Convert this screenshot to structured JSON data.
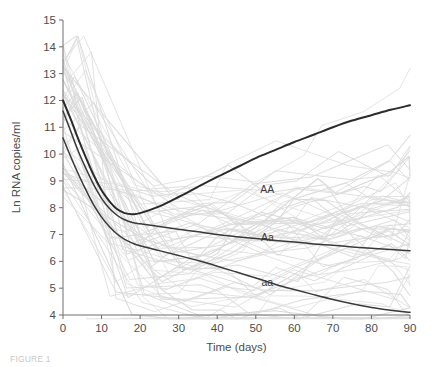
{
  "chart_data": {
    "type": "line",
    "title": "",
    "xlabel": "Time (days)",
    "ylabel": "Ln RNA copies/ml",
    "xlim": [
      0,
      90
    ],
    "ylim": [
      4,
      15
    ],
    "xticks": [
      0,
      10,
      20,
      30,
      40,
      50,
      60,
      70,
      80,
      90
    ],
    "yticks": [
      4,
      5,
      6,
      7,
      8,
      9,
      10,
      11,
      12,
      13,
      14,
      15
    ],
    "grid": false,
    "legend": "inline-annotations",
    "annotations": [
      {
        "text": "AA",
        "x": 53,
        "y": 8.55
      },
      {
        "text": "Aa",
        "x": 53,
        "y": 6.75
      },
      {
        "text": "aa",
        "x": 53,
        "y": 5.1
      }
    ],
    "series": [
      {
        "name": "AA",
        "color": "#2b2b2b",
        "width": 2.0,
        "x": [
          0,
          2,
          4,
          6,
          8,
          10,
          12,
          14,
          16,
          18,
          20,
          25,
          30,
          35,
          40,
          45,
          50,
          55,
          60,
          65,
          70,
          75,
          80,
          85,
          90
        ],
        "values": [
          12.0,
          11.3,
          10.55,
          9.85,
          9.2,
          8.65,
          8.25,
          7.95,
          7.8,
          7.76,
          7.8,
          8.05,
          8.4,
          8.78,
          9.15,
          9.5,
          9.85,
          10.15,
          10.45,
          10.72,
          11.0,
          11.25,
          11.45,
          11.65,
          11.82
        ]
      },
      {
        "name": "Aa",
        "color": "#3a3a3a",
        "width": 1.5,
        "x": [
          0,
          2,
          4,
          6,
          8,
          10,
          12,
          14,
          16,
          18,
          20,
          25,
          30,
          35,
          40,
          45,
          50,
          55,
          60,
          65,
          70,
          75,
          80,
          85,
          90
        ],
        "values": [
          11.6,
          10.85,
          10.1,
          9.45,
          8.85,
          8.35,
          7.98,
          7.72,
          7.55,
          7.45,
          7.4,
          7.3,
          7.2,
          7.1,
          7.0,
          6.92,
          6.85,
          6.78,
          6.72,
          6.65,
          6.6,
          6.54,
          6.49,
          6.44,
          6.4
        ]
      },
      {
        "name": "aa",
        "color": "#3a3a3a",
        "width": 1.5,
        "x": [
          0,
          2,
          4,
          6,
          8,
          10,
          12,
          14,
          16,
          18,
          20,
          25,
          30,
          35,
          40,
          45,
          50,
          55,
          60,
          65,
          70,
          75,
          80,
          85,
          90
        ],
        "values": [
          10.6,
          9.9,
          9.25,
          8.65,
          8.1,
          7.65,
          7.3,
          7.02,
          6.82,
          6.68,
          6.58,
          6.4,
          6.22,
          6.03,
          5.82,
          5.6,
          5.38,
          5.15,
          4.95,
          4.76,
          4.58,
          4.42,
          4.28,
          4.18,
          4.1
        ]
      }
    ],
    "background_series_note": "individual patient trajectories, light gray"
  },
  "caption": {
    "text": "FIGURE 1"
  }
}
